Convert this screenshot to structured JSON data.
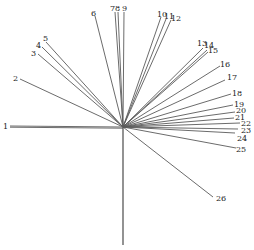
{
  "diagram": {
    "type": "radial-vector-diagram",
    "center": [
      123,
      127
    ],
    "vertical_axis_end": [
      123,
      245
    ],
    "line_color": "#5a5a5a",
    "label_color": "#222222",
    "rays": [
      {
        "label": "1",
        "end": [
          10,
          126
        ],
        "label_pos": [
          3,
          129
        ]
      },
      {
        "label": "2",
        "end": [
          20,
          79
        ],
        "label_pos": [
          13,
          81
        ]
      },
      {
        "label": "3",
        "end": [
          38,
          54
        ],
        "label_pos": [
          31,
          56
        ]
      },
      {
        "label": "4",
        "end": [
          42,
          47
        ],
        "label_pos": [
          36,
          48
        ]
      },
      {
        "label": "5",
        "end": [
          46,
          42
        ],
        "label_pos": [
          43,
          41
        ]
      },
      {
        "label": "6",
        "end": [
          95,
          16
        ],
        "label_pos": [
          91,
          16
        ]
      },
      {
        "label": "7",
        "end": [
          115,
          12
        ],
        "label_pos": [
          110,
          11
        ]
      },
      {
        "label": "8",
        "end": [
          118,
          12
        ],
        "label_pos": [
          115,
          11
        ]
      },
      {
        "label": "9",
        "end": [
          124,
          12
        ],
        "label_pos": [
          122,
          11
        ]
      },
      {
        "label": "10",
        "end": [
          161,
          17
        ],
        "label_pos": [
          157,
          17
        ]
      },
      {
        "label": "11",
        "end": [
          166,
          19
        ],
        "label_pos": [
          164,
          19
        ]
      },
      {
        "label": "12",
        "end": [
          171,
          20
        ],
        "label_pos": [
          171,
          21
        ]
      },
      {
        "label": "13",
        "end": [
          203,
          48
        ],
        "label_pos": [
          197,
          46
        ]
      },
      {
        "label": "14",
        "end": [
          207,
          50
        ],
        "label_pos": [
          204,
          48
        ]
      },
      {
        "label": "15",
        "end": [
          208,
          52
        ],
        "label_pos": [
          208,
          53
        ]
      },
      {
        "label": "16",
        "end": [
          220,
          66
        ],
        "label_pos": [
          220,
          67
        ]
      },
      {
        "label": "17",
        "end": [
          225,
          80
        ],
        "label_pos": [
          227,
          80
        ]
      },
      {
        "label": "18",
        "end": [
          231,
          94
        ],
        "label_pos": [
          232,
          96
        ]
      },
      {
        "label": "19",
        "end": [
          233,
          105
        ],
        "label_pos": [
          234,
          107
        ]
      },
      {
        "label": "20",
        "end": [
          235,
          112
        ],
        "label_pos": [
          236,
          113
        ]
      },
      {
        "label": "21",
        "end": [
          234,
          118
        ],
        "label_pos": [
          235,
          120
        ]
      },
      {
        "label": "22",
        "end": [
          240,
          123
        ],
        "label_pos": [
          241,
          126
        ]
      },
      {
        "label": "23",
        "end": [
          238,
          129
        ],
        "label_pos": [
          241,
          133
        ]
      },
      {
        "label": "24",
        "end": [
          235,
          133
        ],
        "label_pos": [
          237,
          141
        ]
      },
      {
        "label": "25",
        "end": [
          236,
          148
        ],
        "label_pos": [
          236,
          152
        ]
      },
      {
        "label": "26",
        "end": [
          213,
          197
        ],
        "label_pos": [
          216,
          201
        ]
      }
    ]
  }
}
